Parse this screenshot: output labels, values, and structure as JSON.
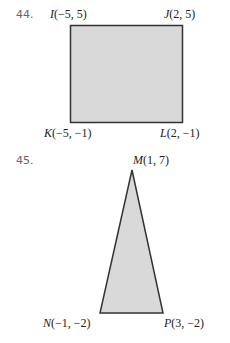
{
  "problems": [
    {
      "number": "44.",
      "shape": "rectangle",
      "fill": "#d9d9d9",
      "stroke": "#333333",
      "vertices": [
        {
          "name": "I",
          "coords": "(−5, 5)"
        },
        {
          "name": "J",
          "coords": "(2, 5)"
        },
        {
          "name": "K",
          "coords": "(−5, −1)"
        },
        {
          "name": "L",
          "coords": "(2, −1)"
        }
      ]
    },
    {
      "number": "45.",
      "shape": "triangle",
      "fill": "#d9d9d9",
      "stroke": "#333333",
      "vertices": [
        {
          "name": "M",
          "coords": "(1, 7)"
        },
        {
          "name": "N",
          "coords": "(−1, −2)"
        },
        {
          "name": "P",
          "coords": "(3, −2)"
        }
      ]
    }
  ]
}
